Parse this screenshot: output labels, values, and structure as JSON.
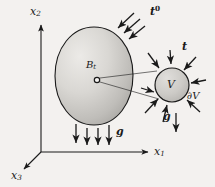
{
  "figure": {
    "kind": "continuum-mechanics-free-body-diagram",
    "background_color": "#f3f1ef",
    "ink_color": "#1a1a1a",
    "body_fill_light": "#e2e0dd",
    "body_fill_dark": "#a8a6a3",
    "labels": {
      "axis_x1": "x",
      "axis_x1_sub": "1",
      "axis_x2": "x",
      "axis_x2_sub": "2",
      "axis_x3": "x",
      "axis_x3_sub": "3",
      "body": "B",
      "body_sub": "t",
      "traction_boundary": "t",
      "traction_boundary_sup": "0",
      "traction_internal": "t",
      "volume": "V",
      "volume_boundary": "∂V",
      "gravity_body": "g",
      "gravity_volume": "g"
    }
  },
  "geometry": {
    "origin": [
      41,
      152
    ],
    "axis_x1_tip": [
      150,
      152
    ],
    "axis_x2_tip": [
      41,
      22
    ],
    "axis_x3_tip": [
      22,
      171
    ],
    "body_center": [
      94,
      76
    ],
    "body_rx": 39,
    "body_ry": 49,
    "material_point": [
      97,
      80
    ],
    "volume_center": [
      172,
      85
    ],
    "volume_r": 17
  }
}
